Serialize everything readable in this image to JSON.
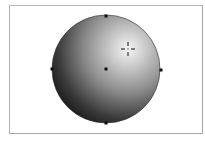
{
  "illustration": {
    "shape": "circle",
    "fill": "radial-gradient",
    "gradient": {
      "highlight_color": "#f2f2f2",
      "mid_color": "#8c8c8c",
      "shadow_color": "#1a1a1a",
      "highlight_position": [
        128,
        49
      ]
    },
    "center": [
      106,
      69
    ],
    "radius": 54,
    "anchor_points": [
      {
        "name": "top",
        "x": 106,
        "y": 16
      },
      {
        "name": "right",
        "x": 161,
        "y": 70
      },
      {
        "name": "bottom",
        "x": 106,
        "y": 123
      },
      {
        "name": "left",
        "x": 52,
        "y": 69
      },
      {
        "name": "center",
        "x": 106,
        "y": 69
      }
    ],
    "gradient_origin_marker": "crosshair-icon"
  },
  "frame": {
    "border_color": "#a8a8a8"
  }
}
